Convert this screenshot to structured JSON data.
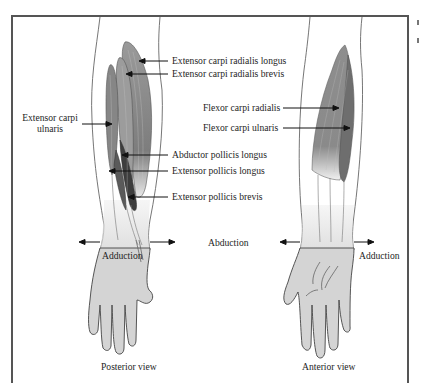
{
  "figure": {
    "colors": {
      "skin": "#d3d3d3",
      "skin_light": "#ececec",
      "muscle": "#8a8a8a",
      "muscle_dark": "#4a4a4a",
      "outline": "#555555",
      "frame": "#555555",
      "text": "#1e1e1e"
    },
    "posterior": {
      "muscles": [
        {
          "label": "Extensor  carpi  radialis longus"
        },
        {
          "label": "Extensor carpi radialis brevis"
        },
        {
          "label_line1": "Extensor  carpi",
          "label_line2": "ulnaris"
        },
        {
          "label": "Abductor pollicis longus"
        },
        {
          "label": "Extensor pollicis longus"
        },
        {
          "label": "Extensor pollicis brevis"
        }
      ],
      "motion_label": "Adduction",
      "view_label": "Posterior view"
    },
    "center_motion_label": "Abduction",
    "anterior": {
      "muscles": [
        {
          "label": "Flexor carpi radialis"
        },
        {
          "label": "Flexor carpi ulnaris"
        }
      ],
      "motion_label": "Adduction",
      "view_label": "Anterior view"
    }
  }
}
